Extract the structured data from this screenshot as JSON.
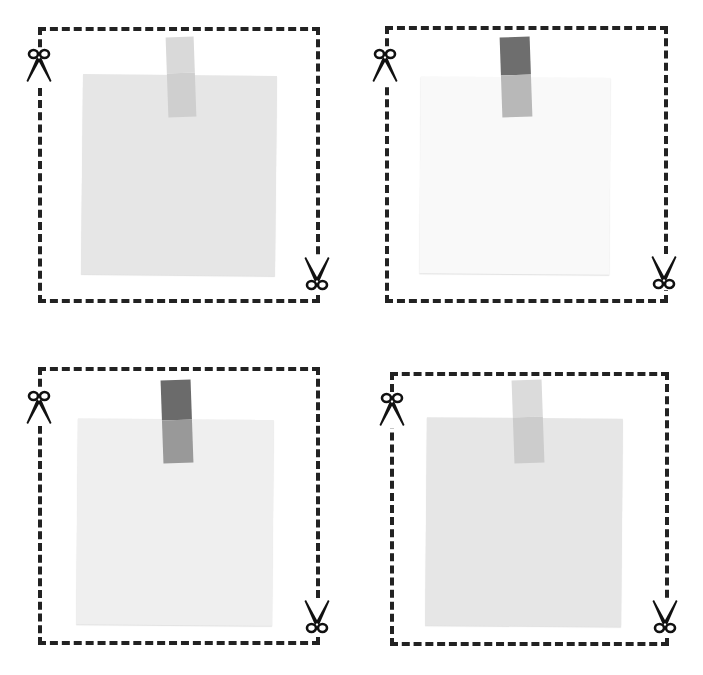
{
  "canvas": {
    "width": 703,
    "height": 675,
    "background": "#ffffff"
  },
  "colors": {
    "frame": "#222222",
    "scissors": "#111111"
  },
  "cards": [
    {
      "id": "top-left",
      "frame": {
        "x": 38,
        "y": 27,
        "w": 282,
        "h": 276
      },
      "note": {
        "x": 82,
        "y": 75,
        "w": 194,
        "h": 200,
        "rotate": 0.6,
        "color": "#e6e6e6"
      },
      "tape": {
        "x": 167,
        "y": 37,
        "w": 28,
        "h": 80,
        "rotate": -2,
        "top_color": "#d9d9d9",
        "bottom_color": "#cfcfcf",
        "split": 0.45
      },
      "scissors_top": {
        "x": 24,
        "y": 48,
        "rotate": 0
      },
      "scissors_bottom": {
        "x": 302,
        "y": 255,
        "rotate": 180
      }
    },
    {
      "id": "top-right",
      "frame": {
        "x": 385,
        "y": 26,
        "w": 283,
        "h": 277
      },
      "note": {
        "x": 420,
        "y": 77,
        "w": 190,
        "h": 197,
        "rotate": 0.4,
        "color": "#f9f9f9"
      },
      "tape": {
        "x": 501,
        "y": 37,
        "w": 30,
        "h": 80,
        "rotate": -2,
        "top_color": "#6e6e6e",
        "bottom_color": "#b8b8b8",
        "split": 0.48
      },
      "scissors_top": {
        "x": 370,
        "y": 48,
        "rotate": 0
      },
      "scissors_bottom": {
        "x": 649,
        "y": 254,
        "rotate": 180
      }
    },
    {
      "id": "bottom-left",
      "frame": {
        "x": 38,
        "y": 367,
        "w": 282,
        "h": 278
      },
      "note": {
        "x": 77,
        "y": 419,
        "w": 196,
        "h": 206,
        "rotate": 0.5,
        "color": "#efefef"
      },
      "tape": {
        "x": 162,
        "y": 380,
        "w": 30,
        "h": 83,
        "rotate": -2,
        "top_color": "#6b6b6b",
        "bottom_color": "#999999",
        "split": 0.48
      },
      "scissors_top": {
        "x": 24,
        "y": 390,
        "rotate": 0
      },
      "scissors_bottom": {
        "x": 302,
        "y": 598,
        "rotate": 180
      }
    },
    {
      "id": "bottom-right",
      "frame": {
        "x": 390,
        "y": 372,
        "w": 279,
        "h": 274
      },
      "note": {
        "x": 426,
        "y": 418,
        "w": 196,
        "h": 208,
        "rotate": 0.5,
        "color": "#e6e6e6"
      },
      "tape": {
        "x": 513,
        "y": 380,
        "w": 30,
        "h": 83,
        "rotate": -2,
        "top_color": "#dbdbdb",
        "bottom_color": "#cccccc",
        "split": 0.45
      },
      "scissors_top": {
        "x": 377,
        "y": 392,
        "rotate": 0
      },
      "scissors_bottom": {
        "x": 650,
        "y": 598,
        "rotate": 180
      }
    }
  ]
}
